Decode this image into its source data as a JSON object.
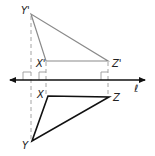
{
  "diagram": {
    "line": {
      "label": "ℓ",
      "y": 80,
      "x1": 8,
      "x2": 147
    },
    "image_triangle": {
      "label": "X'Y'Z'",
      "color": "#8a8a8a",
      "vertices": {
        "Y'": {
          "label": "Y'",
          "x": 31,
          "y": 14
        },
        "X'": {
          "label": "X'",
          "x": 46,
          "y": 61
        },
        "Z'": {
          "label": "Z'",
          "x": 108,
          "y": 61
        }
      }
    },
    "preimage_triangle": {
      "label": "XYZ",
      "color": "#111111",
      "vertices": {
        "X": {
          "label": "X",
          "x": 48,
          "y": 96
        },
        "Y": {
          "label": "Y",
          "x": 32,
          "y": 141
        },
        "Z": {
          "label": "Z",
          "x": 109,
          "y": 97
        }
      }
    },
    "labels": {
      "y_prime": "Y'",
      "x_prime": "X'",
      "z_prime": "Z'",
      "x": "X",
      "y": "Y",
      "z": "Z",
      "line": "ℓ"
    },
    "dashed_color": "#9a9a9a",
    "right_angle_marks": 3
  }
}
